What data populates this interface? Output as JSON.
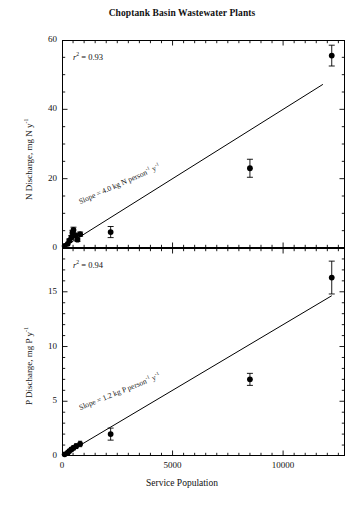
{
  "figure": {
    "title": "Choptank Basin Wastewater Plants",
    "xaxis_title": "Service Population"
  },
  "chart_data": [
    {
      "type": "scatter",
      "panel": "top",
      "title": "Choptank Basin Wastewater Plants",
      "xlabel": "Service Population",
      "ylabel": "N Discharge, mg N y⁻¹",
      "ylabel_plain": "N Discharge, mg N y-1",
      "xlim": [
        0,
        12800
      ],
      "ylim": [
        0,
        60
      ],
      "yticks": [
        0,
        20,
        40,
        60
      ],
      "ytick_labels": [
        "0",
        "20",
        "40",
        "60"
      ],
      "xticks": [
        0,
        5000,
        10000
      ],
      "xtick_labels": [
        "0",
        "5000",
        "10000"
      ],
      "y_minor_tick_step": 5,
      "x_minor_tick_step": 500,
      "grid": false,
      "legend": "none",
      "annotations": [
        {
          "name": "r-squared",
          "text": "r² = 0.93",
          "value": 0.93
        },
        {
          "name": "slope-label",
          "text": "Slope = 4.0 kg N person⁻¹ y⁻¹",
          "value": 4.0,
          "units": "kg N person-1 y-1"
        }
      ],
      "fit_line": {
        "slope_per_person": 0.004,
        "intercept": 0,
        "x_start": 400,
        "x_end": 11800
      },
      "points": [
        {
          "x": 120,
          "y": 0.6,
          "yerr": 0.3
        },
        {
          "x": 260,
          "y": 1.2,
          "yerr": 0.4
        },
        {
          "x": 330,
          "y": 2.1,
          "yerr": 0.5
        },
        {
          "x": 420,
          "y": 3.0,
          "yerr": 0.6
        },
        {
          "x": 470,
          "y": 4.4,
          "yerr": 0.7
        },
        {
          "x": 520,
          "y": 5.2,
          "yerr": 0.8
        },
        {
          "x": 600,
          "y": 3.6,
          "yerr": 0.6
        },
        {
          "x": 700,
          "y": 2.4,
          "yerr": 0.5
        },
        {
          "x": 820,
          "y": 4.0,
          "yerr": 0.6
        },
        {
          "x": 2200,
          "y": 4.6,
          "yerr": 1.6
        },
        {
          "x": 8500,
          "y": 23.0,
          "yerr": 2.6
        },
        {
          "x": 12200,
          "y": 55.5,
          "yerr": 3.0
        }
      ]
    },
    {
      "type": "scatter",
      "panel": "bottom",
      "xlabel": "Service Population",
      "ylabel": "P Discharge, mg P y⁻¹",
      "ylabel_plain": "P Discharge, mg P y-1",
      "xlim": [
        0,
        12800
      ],
      "ylim": [
        0,
        19
      ],
      "yticks": [
        0,
        5,
        10,
        15
      ],
      "ytick_labels": [
        "0",
        "5",
        "10",
        "15"
      ],
      "xticks": [
        0,
        5000,
        10000
      ],
      "xtick_labels": [
        "0",
        "5000",
        "10000"
      ],
      "y_minor_tick_step": 1,
      "x_minor_tick_step": 500,
      "grid": false,
      "legend": "none",
      "annotations": [
        {
          "name": "r-squared",
          "text": "r² = 0.94",
          "value": 0.94
        },
        {
          "name": "slope-label",
          "text": "Slope = 1.2 kg P person⁻¹ y⁻¹",
          "value": 1.2,
          "units": "kg P person-1 y-1"
        }
      ],
      "fit_line": {
        "slope_per_person": 0.0012,
        "intercept": 0,
        "x_start": 300,
        "x_end": 12200
      },
      "points": [
        {
          "x": 120,
          "y": 0.15,
          "yerr": 0.1
        },
        {
          "x": 260,
          "y": 0.3,
          "yerr": 0.12
        },
        {
          "x": 330,
          "y": 0.45,
          "yerr": 0.15
        },
        {
          "x": 420,
          "y": 0.6,
          "yerr": 0.18
        },
        {
          "x": 520,
          "y": 0.75,
          "yerr": 0.2
        },
        {
          "x": 640,
          "y": 0.9,
          "yerr": 0.22
        },
        {
          "x": 820,
          "y": 1.1,
          "yerr": 0.25
        },
        {
          "x": 2200,
          "y": 2.0,
          "yerr": 0.55
        },
        {
          "x": 8500,
          "y": 7.0,
          "yerr": 0.55
        },
        {
          "x": 12200,
          "y": 16.3,
          "yerr": 1.5
        }
      ]
    }
  ],
  "top_panel": {
    "r2_prefix": "r",
    "r2_sup": "2",
    "r2_rest": " = 0.93",
    "ylabel_pre": "N Discharge, mg N y",
    "ylabel_sup": "-1",
    "slope_pre": "Slope = 4.0 kg N person",
    "slope_sup1": "-1",
    "slope_mid": " y",
    "slope_sup2": "-1",
    "ytick_labels": [
      "60",
      "40",
      "20",
      "0"
    ]
  },
  "bottom_panel": {
    "r2_prefix": "r",
    "r2_sup": "2",
    "r2_rest": " = 0.94",
    "ylabel_pre": "P Discharge, mg P y",
    "ylabel_sup": "-1",
    "slope_pre": "Slope = 1.2 kg P person",
    "slope_sup1": "-1",
    "slope_mid": " y",
    "slope_sup2": "-1",
    "ytick_labels": [
      "15",
      "10",
      "5",
      "0"
    ]
  },
  "xaxis": {
    "tick_labels": [
      "0",
      "5000",
      "10000"
    ]
  }
}
